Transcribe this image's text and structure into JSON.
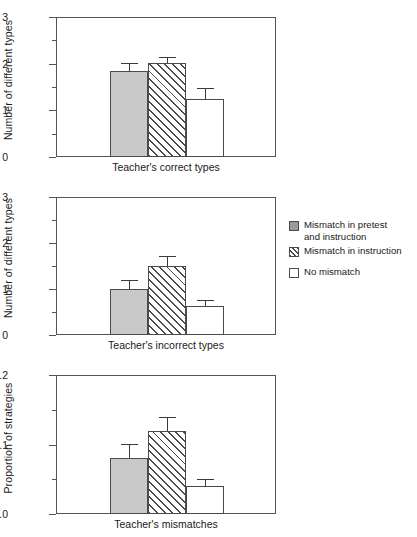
{
  "figure": {
    "background": "#ffffff",
    "bar_fill_solid": "#c9c9c9",
    "bar_outline": "#4a4a4a",
    "axis_color": "#555555"
  },
  "legend": {
    "position": "right-middle",
    "entries": [
      {
        "key": "solid",
        "label": "Mismatch in pretest",
        "label2": "and instruction",
        "swatch": "gray-filled-square-icon"
      },
      {
        "key": "hatch",
        "label": "Mismatch in instruction",
        "label2": "",
        "swatch": "hatched-square-icon"
      },
      {
        "key": "open",
        "label": "No mismatch",
        "label2": "",
        "swatch": "white-square-icon"
      }
    ]
  },
  "chart_data": [
    {
      "type": "bar",
      "title": "",
      "xlabel": "Teacher's correct types",
      "ylabel": "Number of different types",
      "categories": [
        "Mismatch in pretest and instruction",
        "Mismatch in instruction",
        "No mismatch"
      ],
      "values": [
        1.85,
        2.02,
        1.25
      ],
      "errors": [
        0.17,
        0.12,
        0.22
      ],
      "ylim": [
        0,
        3
      ],
      "yticks": [
        0,
        1,
        2,
        3
      ],
      "ytick_labels": [
        "0",
        "1",
        "2",
        "3"
      ],
      "yminor": [
        0.5,
        1.5,
        2.5
      ],
      "grid": false,
      "legend": "external-right"
    },
    {
      "type": "bar",
      "title": "",
      "xlabel": "Teacher's incorrect types",
      "ylabel": "Number of different types",
      "categories": [
        "Mismatch in pretest and instruction",
        "Mismatch in instruction",
        "No mismatch"
      ],
      "values": [
        1.0,
        1.5,
        0.62
      ],
      "errors": [
        0.2,
        0.22,
        0.15
      ],
      "ylim": [
        0,
        3
      ],
      "yticks": [
        0,
        1,
        2,
        3
      ],
      "ytick_labels": [
        "0",
        "1",
        "2",
        "3"
      ],
      "yminor": [
        0.5,
        1.5,
        2.5
      ],
      "grid": false,
      "legend": "external-right"
    },
    {
      "type": "bar",
      "title": "",
      "xlabel": "Teacher's mismatches",
      "ylabel": "Proportion of strategies",
      "categories": [
        "Mismatch in pretest and instruction",
        "Mismatch in instruction",
        "No mismatch"
      ],
      "values": [
        0.08,
        0.12,
        0.04
      ],
      "errors": [
        0.021,
        0.019,
        0.011
      ],
      "ylim": [
        0,
        0.2
      ],
      "yticks": [
        0,
        0.1,
        0.2
      ],
      "ytick_labels": [
        "0.0",
        "0.1",
        "0.2"
      ],
      "yminor": [
        0.05,
        0.15
      ],
      "grid": false,
      "legend": "external-right"
    }
  ]
}
